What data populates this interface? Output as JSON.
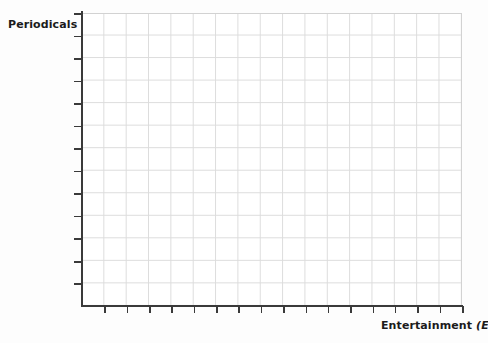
{
  "figure": {
    "kind": "blank-coordinate-grid",
    "background_color": "#fdfdfd",
    "plot_background_color": "#ffffff"
  },
  "axes": {
    "y": {
      "label_text": "Periodicals",
      "label_variable": "(P)",
      "variable_symbol": "P",
      "tick_count": 13,
      "tick_spacing_px": 22.54,
      "spine_color": "#3a3a3a",
      "has_numeric_tick_labels": false
    },
    "x": {
      "label_text": "Entertainment",
      "label_variable": "(E)",
      "variable_symbol": "E",
      "tick_count": 17,
      "tick_spacing_px": 22.35,
      "spine_color": "#3a3a3a",
      "has_numeric_tick_labels": false
    }
  },
  "grid": {
    "columns": 17,
    "rows": 13,
    "cell_width_px": 22.35,
    "cell_height_px": 22.54,
    "line_color": "#dcdcdc",
    "border_color": "#d2d2d2",
    "visible": true
  },
  "chart_data": {
    "type": "scatter",
    "title": "",
    "subtitle": "",
    "xlabel": "Entertainment (E)",
    "ylabel": "Periodicals (P)",
    "x": [],
    "y": [],
    "series": [],
    "annotations": [],
    "legend": [],
    "legend_position": "none",
    "grid": true,
    "xlim": [
      0,
      17
    ],
    "ylim": [
      0,
      13
    ],
    "xticks": [
      0,
      1,
      2,
      3,
      4,
      5,
      6,
      7,
      8,
      9,
      10,
      11,
      12,
      13,
      14,
      15,
      16,
      17
    ],
    "yticks": [
      0,
      1,
      2,
      3,
      4,
      5,
      6,
      7,
      8,
      9,
      10,
      11,
      12,
      13
    ],
    "xtick_labels": [],
    "ytick_labels": [],
    "note": "Empty graph template: axes and gridlines only, no plotted data."
  }
}
